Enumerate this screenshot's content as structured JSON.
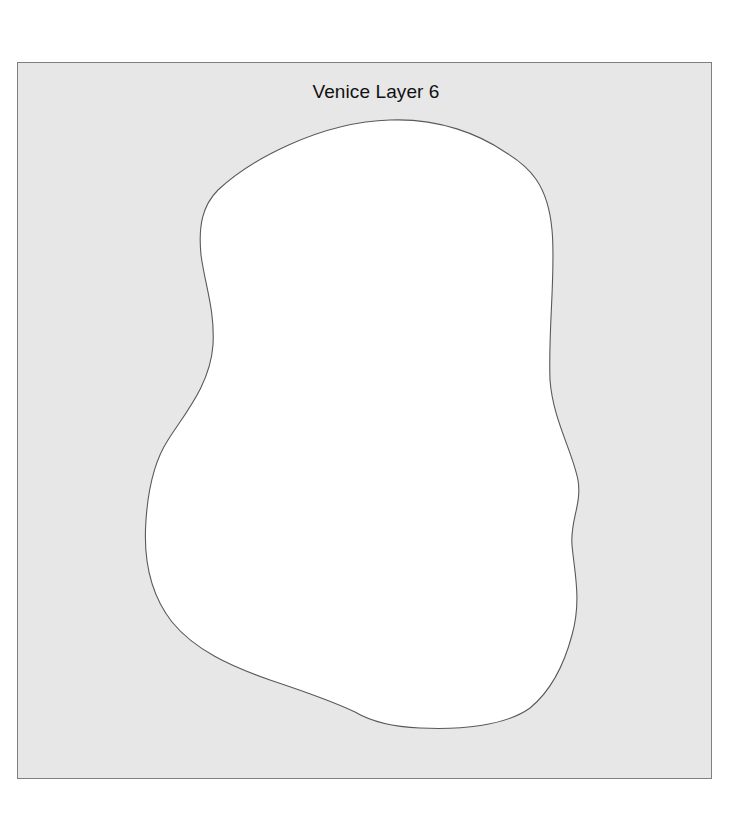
{
  "diagram": {
    "title": "Venice Layer 6",
    "colors": {
      "background": "#ffffff",
      "frame_fill": "#e7e7e7",
      "frame_border": "#7f7f7f",
      "shape_fill": "#ffffff",
      "shape_stroke": "#595959",
      "title_text": "#111111"
    },
    "shape": {
      "type": "irregular-blob",
      "description": "White closed freeform outline shape centered within grey square frame"
    }
  }
}
